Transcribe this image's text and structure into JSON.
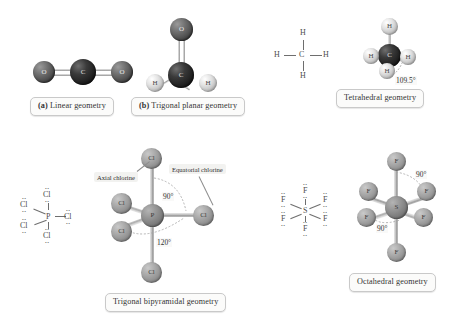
{
  "figure": {
    "background": "#ffffff"
  },
  "panels": [
    {
      "id": "linear",
      "caption_prefix": "(a)",
      "caption": "Linear geometry",
      "molecule": "CO2",
      "atoms": [
        "O",
        "C",
        "O"
      ],
      "bond_type": "double",
      "angle": "180°"
    },
    {
      "id": "trigonal-planar",
      "caption_prefix": "(b)",
      "caption": "Trigonal planar geometry",
      "molecule": "H2CO",
      "atoms": [
        "O",
        "C",
        "H",
        "H"
      ],
      "bond_type": "double-and-single",
      "angle": "120°"
    },
    {
      "id": "tetrahedral",
      "caption_prefix": "",
      "caption": "Tetrahedral geometry",
      "molecule": "CH4",
      "atoms": [
        "C",
        "H",
        "H",
        "H",
        "H"
      ],
      "angle_label": "109.5°",
      "lewis_center": "C",
      "lewis_outer": [
        "H",
        "H",
        "H",
        "H"
      ]
    },
    {
      "id": "trigonal-bipyramidal",
      "caption_prefix": "",
      "caption": "Trigonal bipyramidal geometry",
      "molecule": "PCl5",
      "atoms": [
        "P",
        "Cl",
        "Cl",
        "Cl",
        "Cl",
        "Cl"
      ],
      "angle_labels": [
        "90°",
        "120°"
      ],
      "annotations": [
        "Axial chlorine",
        "Equatorial chlorine"
      ],
      "lewis_center": "P",
      "lewis_outer": [
        "Cl",
        "Cl",
        "Cl",
        "Cl",
        "Cl"
      ]
    },
    {
      "id": "octahedral",
      "caption_prefix": "",
      "caption": "Octahedral geometry",
      "molecule": "SF6",
      "atoms": [
        "S",
        "F",
        "F",
        "F",
        "F",
        "F",
        "F"
      ],
      "angle_labels": [
        "90°",
        "90°"
      ],
      "lewis_center": "S",
      "lewis_outer": [
        "F",
        "F",
        "F",
        "F",
        "F",
        "F"
      ]
    }
  ],
  "atom_labels": {
    "O": "O",
    "C": "C",
    "H": "H",
    "Cl": "Cl",
    "F": "F",
    "P": "P",
    "S": "S"
  },
  "lewis": {
    "methane": {
      "center": "C",
      "top": "H",
      "bottom": "H",
      "left": "H",
      "right": "H"
    },
    "pcl5": {
      "center": "P",
      "labels": [
        "Cl",
        "Cl",
        "Cl",
        "Cl",
        "Cl"
      ]
    },
    "sf6": {
      "center": "S",
      "labels": [
        "F",
        "F",
        "F",
        "F",
        "F",
        "F"
      ]
    }
  },
  "angles": {
    "tetra": "109.5°",
    "tbp_axial": "90°",
    "tbp_equatorial": "120°",
    "oct_top": "90°",
    "oct_bottom": "90°"
  },
  "annotations": {
    "axial": "Axial chlorine",
    "equatorial": "Equatorial chlorine"
  },
  "colors": {
    "oxygen": "#4a4a4a",
    "carbon": "#1d1d1d",
    "hydrogen": "#e2e2e2",
    "chlorine": "#a9a9a9",
    "fluorine": "#ababab",
    "phosphorus": "#949494",
    "sulfur": "#949494",
    "bond": "#9f9f9f",
    "caption_bg": "#fbfbfa",
    "caption_border": "#c9c9c9"
  }
}
